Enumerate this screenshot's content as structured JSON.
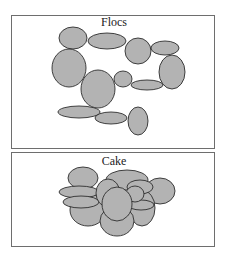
{
  "panels": [
    {
      "title": "Flocs",
      "box": {
        "x": 11,
        "y": 15,
        "w": 203,
        "h": 133
      },
      "title_pos": {
        "x": 114,
        "y": 26
      },
      "particles": [
        {
          "cx": 73,
          "cy": 38,
          "rx": 14,
          "ry": 11
        },
        {
          "cx": 107,
          "cy": 41,
          "rx": 19,
          "ry": 8
        },
        {
          "cx": 138,
          "cy": 51,
          "rx": 13,
          "ry": 13
        },
        {
          "cx": 165,
          "cy": 48,
          "rx": 14,
          "ry": 7
        },
        {
          "cx": 69,
          "cy": 68,
          "rx": 17,
          "ry": 19
        },
        {
          "cx": 172,
          "cy": 72,
          "rx": 13,
          "ry": 17
        },
        {
          "cx": 98,
          "cy": 89,
          "rx": 17,
          "ry": 19
        },
        {
          "cx": 123,
          "cy": 79,
          "rx": 9,
          "ry": 8
        },
        {
          "cx": 147,
          "cy": 85,
          "rx": 16,
          "ry": 5
        },
        {
          "cx": 79,
          "cy": 112,
          "rx": 21,
          "ry": 6
        },
        {
          "cx": 111,
          "cy": 118,
          "rx": 16,
          "ry": 6
        },
        {
          "cx": 138,
          "cy": 121,
          "rx": 10,
          "ry": 14
        }
      ]
    },
    {
      "title": "Cake",
      "box": {
        "x": 11,
        "y": 152,
        "w": 203,
        "h": 94
      },
      "title_pos": {
        "x": 114,
        "y": 165
      },
      "particles": [
        {
          "cx": 83,
          "cy": 178,
          "rx": 15,
          "ry": 11
        },
        {
          "cx": 127,
          "cy": 180,
          "rx": 21,
          "ry": 10
        },
        {
          "cx": 160,
          "cy": 191,
          "rx": 15,
          "ry": 13
        },
        {
          "cx": 88,
          "cy": 210,
          "rx": 18,
          "ry": 16
        },
        {
          "cx": 142,
          "cy": 208,
          "rx": 13,
          "ry": 18
        },
        {
          "cx": 117,
          "cy": 221,
          "rx": 17,
          "ry": 15
        },
        {
          "cx": 79,
          "cy": 192,
          "rx": 20,
          "ry": 6
        },
        {
          "cx": 81,
          "cy": 202,
          "rx": 18,
          "ry": 6
        },
        {
          "cx": 108,
          "cy": 193,
          "rx": 12,
          "ry": 14
        },
        {
          "cx": 140,
          "cy": 187,
          "rx": 13,
          "ry": 7
        },
        {
          "cx": 141,
          "cy": 205,
          "rx": 13,
          "ry": 5
        },
        {
          "cx": 135,
          "cy": 194,
          "rx": 9,
          "ry": 8
        },
        {
          "cx": 117,
          "cy": 204,
          "rx": 15,
          "ry": 17
        }
      ]
    }
  ]
}
